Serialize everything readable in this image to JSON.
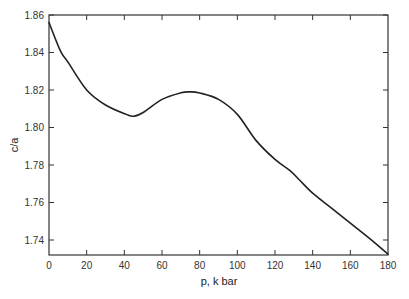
{
  "chart_data": {
    "type": "line",
    "title": "",
    "xlabel": "p, k bar",
    "ylabel": "c/a",
    "xlim": [
      0,
      180
    ],
    "ylim": [
      1.732,
      1.86
    ],
    "xticks": [
      0,
      20,
      40,
      60,
      80,
      100,
      120,
      140,
      160,
      180
    ],
    "xtick_labels": [
      "0",
      "20",
      "40",
      "60",
      "80",
      "100",
      "120",
      "140",
      "160",
      "180"
    ],
    "yticks": [
      1.74,
      1.76,
      1.78,
      1.8,
      1.82,
      1.84,
      1.86
    ],
    "ytick_labels": [
      "1.74",
      "1.76",
      "1.78",
      "1.80",
      "1.82",
      "1.84",
      "1.86"
    ],
    "grid": false,
    "legend": null,
    "series": [
      {
        "name": "c/a",
        "x": [
          0,
          6,
          10,
          20,
          30,
          41,
          45,
          50,
          60,
          70,
          75,
          80,
          90,
          100,
          110,
          120,
          128,
          133,
          140,
          150,
          160,
          170,
          180
        ],
        "y": [
          1.856,
          1.841,
          1.835,
          1.82,
          1.812,
          1.807,
          1.806,
          1.808,
          1.815,
          1.8185,
          1.819,
          1.8184,
          1.815,
          1.807,
          1.793,
          1.783,
          1.777,
          1.772,
          1.765,
          1.757,
          1.749,
          1.741,
          1.7325
        ]
      }
    ]
  },
  "caption": {
    "text": ""
  }
}
